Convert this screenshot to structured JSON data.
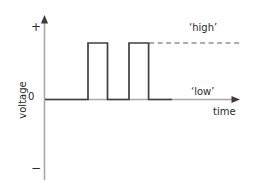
{
  "figure": {
    "background_color": "#ffffff",
    "axis_color": "#a8a8a8",
    "signal_color": "#404040",
    "dash_color": "#5a5a5a",
    "text_color": "#2b2b2b"
  },
  "labels": {
    "y_axis_title": "voltage",
    "x_axis_title": "time",
    "y_plus": "+",
    "y_zero": "0",
    "y_minus": "−",
    "high_annotation": "‘high’",
    "low_annotation": "‘low’"
  },
  "chart_data": {
    "type": "line",
    "title": "",
    "xlabel": "time",
    "ylabel": "voltage",
    "xlim": [
      0,
      100
    ],
    "ylim": [
      -1,
      1
    ],
    "grid": false,
    "legend": null,
    "tick_labels": {
      "y": [
        "+",
        "0",
        "−"
      ]
    },
    "annotations": [
      {
        "text": "‘high’",
        "x": 76,
        "y": 0.82,
        "kind": "level-label"
      },
      {
        "text": "‘low’",
        "x": 77,
        "y": 0.14,
        "kind": "level-label"
      }
    ],
    "reference_lines": [
      {
        "kind": "dashed-horizontal",
        "y": 0.56,
        "x_start": 53,
        "x_end": 99,
        "label": "‘high’"
      }
    ],
    "series": [
      {
        "name": "voltage",
        "style": "square-wave",
        "high_level": 0.56,
        "low_level": 0.0,
        "x": [
          0,
          22,
          22,
          32,
          32,
          43,
          43,
          53,
          53,
          65
        ],
        "values": [
          0,
          0,
          0.56,
          0.56,
          0,
          0,
          0.56,
          0.56,
          0,
          0
        ],
        "pulses": [
          {
            "start": 22,
            "end": 32,
            "level": 0.56
          },
          {
            "start": 43,
            "end": 53,
            "level": 0.56
          }
        ]
      }
    ]
  }
}
